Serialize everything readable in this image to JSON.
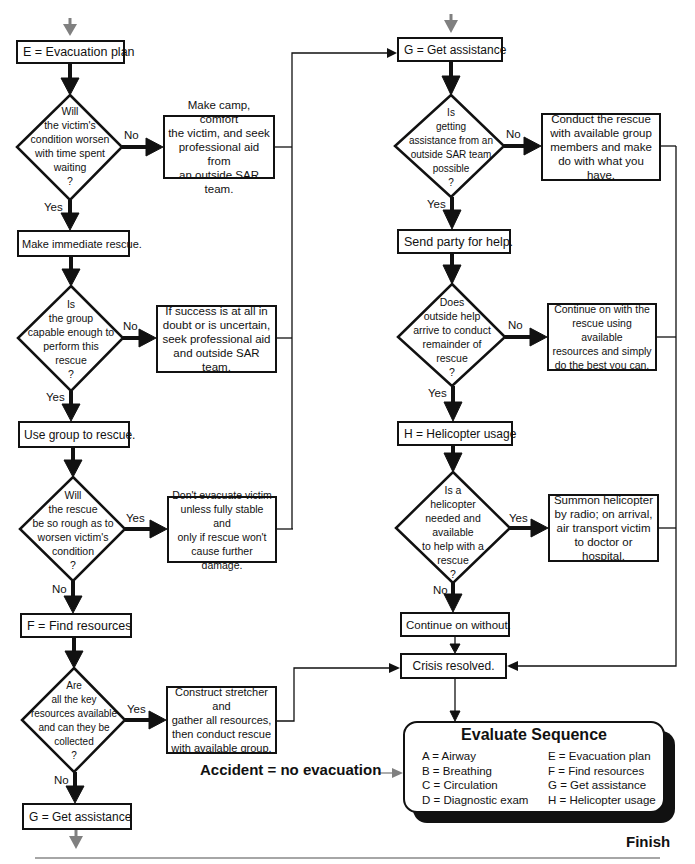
{
  "left_column": {
    "step_e": "E = Evacuation plan",
    "decision_1": {
      "question": "Will\nthe victim's\ncondition worsen\nwith time spent\nwaiting\n?",
      "no_label": "No",
      "yes_label": "Yes",
      "no_action": "Make camp, comfort\nthe victim, and seek\nprofessional aid from\nan outside SAR team."
    },
    "step_immediate": "Make immediate rescue.",
    "decision_2": {
      "question": "Is\nthe group\ncapable enough to\nperform this\nrescue\n?",
      "no_label": "No",
      "yes_label": "Yes",
      "no_action": "If success is at all in\ndoubt or is uncertain,\nseek professional aid\nand outside SAR team."
    },
    "step_use_group": "Use group to rescue.",
    "decision_3": {
      "question": "Will\nthe rescue\nbe so rough as to\nworsen victim's\ncondition\n?",
      "yes_label": "Yes",
      "no_label": "No",
      "yes_action": "Don't evacuate victim\nunless fully stable and\nonly if rescue won't\ncause further damage."
    },
    "step_f": "F = Find resources",
    "decision_4": {
      "question": "Are\nall the key\nresources available\nand can they be\ncollected\n?",
      "yes_label": "Yes",
      "no_label": "No",
      "yes_action": "Construct stretcher and\ngather all resources,\nthen conduct rescue\nwith available group."
    },
    "step_g_bottom": "G = Get assistance"
  },
  "right_column": {
    "step_g": "G = Get assistance",
    "decision_1": {
      "question": "Is\ngetting\nassistance from an\noutside SAR team\npossible\n?",
      "no_label": "No",
      "yes_label": "Yes",
      "no_action": "Conduct the rescue\nwith available group\nmembers and make\ndo with what you have."
    },
    "step_send_party": "Send party for help.",
    "decision_2": {
      "question": "Does\noutside help\narrive to conduct\nremainder of\nrescue\n?",
      "no_label": "No",
      "yes_label": "Yes",
      "no_action": "Continue on with the\nrescue using available\nresources and simply\ndo the best you can."
    },
    "step_h": "H = Helicopter usage",
    "decision_3": {
      "question": "Is a\nhelicopter\nneeded and\navailable\nto help with a\nrescue\n?",
      "yes_label": "Yes",
      "no_label": "No",
      "yes_action": "Summon helicopter\nby radio; on arrival,\nair transport victim\nto doctor or hospital."
    },
    "step_continue_without": "Continue on without.",
    "step_crisis_resolved": "Crisis resolved."
  },
  "evaluate_sequence": {
    "title": "Evaluate Sequence",
    "left_items": [
      "A = Airway",
      "B = Breathing",
      "C = Circulation",
      "D = Diagnostic exam"
    ],
    "right_items": [
      "E = Evacuation plan",
      "F = Find resources",
      "G = Get assistance",
      "H = Helicopter usage"
    ]
  },
  "accident_note": "Accident = no evacuation",
  "finish_label": "Finish",
  "colors": {
    "line": "#111111",
    "entry_arrow": "#808080",
    "background": "#ffffff"
  }
}
